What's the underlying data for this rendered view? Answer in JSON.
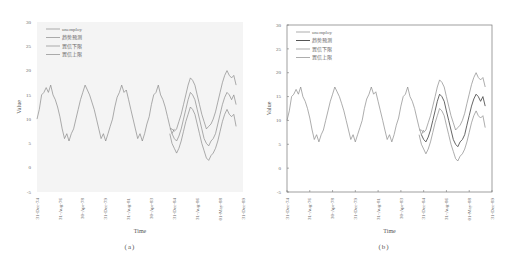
{
  "figure": {
    "panels": [
      {
        "id": "a",
        "caption": "(a)"
      },
      {
        "id": "b",
        "caption": "(b)"
      }
    ]
  },
  "chart_data": [
    {
      "type": "line",
      "panel": "a",
      "title": "",
      "xlabel": "Time",
      "ylabel": "Value",
      "ylim": [
        -5,
        30
      ],
      "yticks": [
        -5,
        0,
        5,
        10,
        15,
        20,
        25,
        30
      ],
      "xtick_labels": [
        "31-Dec-74",
        "31-Aug-76",
        "30-Apr-78",
        "31-Dec-79",
        "31-Aug-81",
        "30-Apr-83",
        "31-Dec-84",
        "31-Aug-86",
        "01-May-88",
        "31-Dec-89"
      ],
      "grid": false,
      "frame": false,
      "background": "#f4f4f4",
      "legend_position": "upper left",
      "legend": [
        "unemploy",
        "趋势预测",
        "置信下限",
        "置信上限"
      ],
      "series_colors": [
        "#8a8a8a",
        "#8a8a8a",
        "#8a8a8a",
        "#8a8a8a"
      ],
      "note": "unemploy observed 1975-1984 peaking ~17 and troughing ~5.5; forecast 1985-1990 with trend peak ~15.5-16, lower bound ~12, upper bound ~18.5-20; lower bound trough ~1.5"
    },
    {
      "type": "line",
      "panel": "b",
      "title": "",
      "xlabel": "Time",
      "ylabel": "Value",
      "ylim": [
        -5,
        30
      ],
      "yticks": [
        -5,
        0,
        5,
        10,
        15,
        20,
        25,
        30
      ],
      "xtick_labels": [
        "31-Dec-74",
        "31-Aug-76",
        "30-Apr-78",
        "31-Dec-79",
        "31-Aug-81",
        "30-Apr-83",
        "31-Dec-84",
        "31-Aug-86",
        "01-May-88",
        "31-Dec-89"
      ],
      "grid": false,
      "frame": true,
      "background": "#ffffff",
      "legend_position": "upper left",
      "legend": [
        "unemploy",
        "趋势预测",
        "置信下限",
        "置信上限"
      ],
      "series_colors": [
        "#8a8a8a",
        "#555555",
        "#8a8a8a",
        "#8a8a8a"
      ]
    }
  ],
  "series": {
    "x_start": 0,
    "x_end": 180,
    "unemploy": [
      [
        0,
        10
      ],
      [
        2,
        12
      ],
      [
        4,
        15
      ],
      [
        6,
        15.5
      ],
      [
        8,
        16.5
      ],
      [
        10,
        15.5
      ],
      [
        12,
        17
      ],
      [
        14,
        15
      ],
      [
        16,
        14
      ],
      [
        18,
        12.5
      ],
      [
        20,
        10.5
      ],
      [
        22,
        8
      ],
      [
        24,
        6
      ],
      [
        26,
        7
      ],
      [
        28,
        5.5
      ],
      [
        30,
        7
      ],
      [
        32,
        8
      ],
      [
        34,
        10
      ],
      [
        36,
        12
      ],
      [
        38,
        14
      ],
      [
        40,
        15.5
      ],
      [
        42,
        17
      ],
      [
        44,
        16
      ],
      [
        46,
        15
      ],
      [
        48,
        13.5
      ],
      [
        50,
        12
      ],
      [
        52,
        10
      ],
      [
        54,
        8
      ],
      [
        56,
        6
      ],
      [
        58,
        7
      ],
      [
        60,
        5.5
      ],
      [
        62,
        7
      ],
      [
        64,
        8.5
      ],
      [
        66,
        10
      ],
      [
        68,
        12.5
      ],
      [
        70,
        14.5
      ],
      [
        72,
        15.5
      ],
      [
        74,
        17
      ],
      [
        76,
        15.5
      ],
      [
        78,
        16
      ],
      [
        80,
        14
      ],
      [
        82,
        12
      ],
      [
        84,
        10
      ],
      [
        86,
        8
      ],
      [
        88,
        6
      ],
      [
        90,
        7
      ],
      [
        92,
        5.5
      ],
      [
        94,
        7
      ],
      [
        96,
        9
      ],
      [
        98,
        10.5
      ],
      [
        100,
        13
      ],
      [
        102,
        15
      ],
      [
        104,
        15.5
      ],
      [
        106,
        17
      ],
      [
        108,
        15
      ],
      [
        110,
        14
      ],
      [
        112,
        12.5
      ],
      [
        114,
        10.5
      ],
      [
        116,
        8.5
      ],
      [
        118,
        7
      ],
      [
        120,
        8
      ]
    ],
    "forecast": [
      [
        118,
        7
      ],
      [
        120,
        6
      ],
      [
        122,
        5.5
      ],
      [
        124,
        6.5
      ],
      [
        126,
        8
      ],
      [
        128,
        10
      ],
      [
        130,
        12
      ],
      [
        132,
        14
      ],
      [
        134,
        15.5
      ],
      [
        136,
        15
      ],
      [
        138,
        14
      ],
      [
        140,
        12
      ],
      [
        142,
        10
      ],
      [
        144,
        8
      ],
      [
        146,
        6
      ],
      [
        148,
        5
      ],
      [
        150,
        4.5
      ],
      [
        152,
        5.5
      ],
      [
        154,
        6
      ],
      [
        156,
        7
      ],
      [
        158,
        9
      ],
      [
        160,
        11
      ],
      [
        162,
        13
      ],
      [
        164,
        14.5
      ],
      [
        166,
        15.5
      ],
      [
        168,
        15
      ],
      [
        170,
        14
      ],
      [
        172,
        15
      ],
      [
        174,
        13
      ]
    ],
    "lower": [
      [
        116,
        7
      ],
      [
        118,
        5
      ],
      [
        120,
        4
      ],
      [
        122,
        3
      ],
      [
        124,
        4
      ],
      [
        126,
        5.5
      ],
      [
        128,
        7.5
      ],
      [
        130,
        9.5
      ],
      [
        132,
        11
      ],
      [
        134,
        12.5
      ],
      [
        136,
        12
      ],
      [
        138,
        11
      ],
      [
        140,
        9
      ],
      [
        142,
        7
      ],
      [
        144,
        5
      ],
      [
        146,
        3.5
      ],
      [
        148,
        2
      ],
      [
        150,
        1.5
      ],
      [
        152,
        2.5
      ],
      [
        154,
        3
      ],
      [
        156,
        4
      ],
      [
        158,
        5.5
      ],
      [
        160,
        7.5
      ],
      [
        162,
        9.5
      ],
      [
        164,
        11
      ],
      [
        166,
        12
      ],
      [
        168,
        11
      ],
      [
        170,
        10.5
      ],
      [
        172,
        11
      ],
      [
        174,
        8.5
      ]
    ],
    "upper": [
      [
        116,
        8
      ],
      [
        118,
        8
      ],
      [
        120,
        7.5
      ],
      [
        122,
        8
      ],
      [
        124,
        9.5
      ],
      [
        126,
        11
      ],
      [
        128,
        13
      ],
      [
        130,
        15
      ],
      [
        132,
        17
      ],
      [
        134,
        18.5
      ],
      [
        136,
        18
      ],
      [
        138,
        17
      ],
      [
        140,
        15
      ],
      [
        142,
        13
      ],
      [
        144,
        11
      ],
      [
        146,
        9.5
      ],
      [
        148,
        8
      ],
      [
        150,
        8.5
      ],
      [
        152,
        9
      ],
      [
        154,
        10
      ],
      [
        156,
        11.5
      ],
      [
        158,
        13.5
      ],
      [
        160,
        15.5
      ],
      [
        162,
        17.5
      ],
      [
        164,
        19
      ],
      [
        166,
        20
      ],
      [
        168,
        19
      ],
      [
        170,
        18.5
      ],
      [
        172,
        19
      ],
      [
        174,
        17
      ]
    ]
  }
}
